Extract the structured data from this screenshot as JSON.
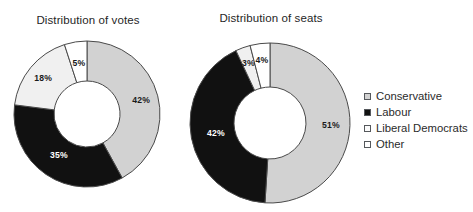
{
  "figure": {
    "background_color": "#ffffff",
    "text_color": "#262626"
  },
  "charts": [
    {
      "id": "votes",
      "title": "Distribution of votes",
      "labels": [
        "42%",
        "35%",
        "18%",
        "5%"
      ]
    },
    {
      "id": "seats",
      "title": "Distribution of seats",
      "labels": [
        "51%",
        "42%",
        "3%",
        "4%"
      ]
    }
  ],
  "legend": {
    "items": [
      {
        "label": "Conservative",
        "swatch_name": "swatch-conservative",
        "color": "#d2d2d2"
      },
      {
        "label": "Labour",
        "swatch_name": "swatch-labour",
        "color": "#111111"
      },
      {
        "label": "Liberal Democrats",
        "swatch_name": "swatch-liberal-democrats",
        "color": "#fbfbfb"
      },
      {
        "label": "Other",
        "swatch_name": "swatch-other",
        "color": "#ffffff"
      }
    ]
  },
  "chart_data": [
    {
      "type": "pie",
      "variant": "donut",
      "title": "Distribution of votes",
      "xlabel": "",
      "ylabel": "",
      "units": "percent",
      "start_angle_oclock": 12,
      "direction": "clockwise",
      "categories": [
        "Conservative",
        "Labour",
        "Liberal Democrats",
        "Other"
      ],
      "values": [
        42,
        35,
        18,
        5
      ],
      "data_labels": [
        "42%",
        "35%",
        "18%",
        "5%"
      ],
      "slice_colors": [
        "#d2d2d2",
        "#111111",
        "#f0f0f0",
        "#ffffff"
      ],
      "label_text_colors": [
        "#1a1a1a",
        "#ffffff",
        "#1a1a1a",
        "#1a1a1a"
      ],
      "legend_position": "right",
      "grid": false
    },
    {
      "type": "pie",
      "variant": "donut",
      "title": "Distribution of seats",
      "xlabel": "",
      "ylabel": "",
      "units": "percent",
      "start_angle_oclock": 12,
      "direction": "clockwise",
      "categories": [
        "Conservative",
        "Labour",
        "Liberal Democrats",
        "Other"
      ],
      "values": [
        51,
        42,
        3,
        4
      ],
      "data_labels": [
        "51%",
        "42%",
        "3%",
        "4%"
      ],
      "slice_colors": [
        "#d2d2d2",
        "#111111",
        "#f0f0f0",
        "#ffffff"
      ],
      "label_text_colors": [
        "#1a1a1a",
        "#ffffff",
        "#1a1a1a",
        "#1a1a1a"
      ],
      "legend_position": "right",
      "grid": false
    }
  ]
}
